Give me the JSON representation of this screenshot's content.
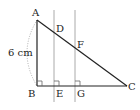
{
  "diagram": {
    "points": {
      "A": {
        "label": "A",
        "x": 37,
        "y": 20
      },
      "B": {
        "label": "B",
        "x": 37,
        "y": 86
      },
      "C": {
        "label": "C",
        "x": 127,
        "y": 86
      },
      "D": {
        "label": "D",
        "x": 54,
        "y": 33
      },
      "E": {
        "label": "E",
        "x": 54,
        "y": 86
      },
      "F": {
        "label": "F",
        "x": 75,
        "y": 49
      },
      "G": {
        "label": "G",
        "x": 75,
        "y": 86
      }
    },
    "measurement": {
      "label": "6 cm",
      "segment": "AB"
    },
    "colors": {
      "triangle": "#222222",
      "parallel_lines": "#aaaaaa",
      "arc": "#999999",
      "right_angle_marks": "#666666"
    }
  }
}
